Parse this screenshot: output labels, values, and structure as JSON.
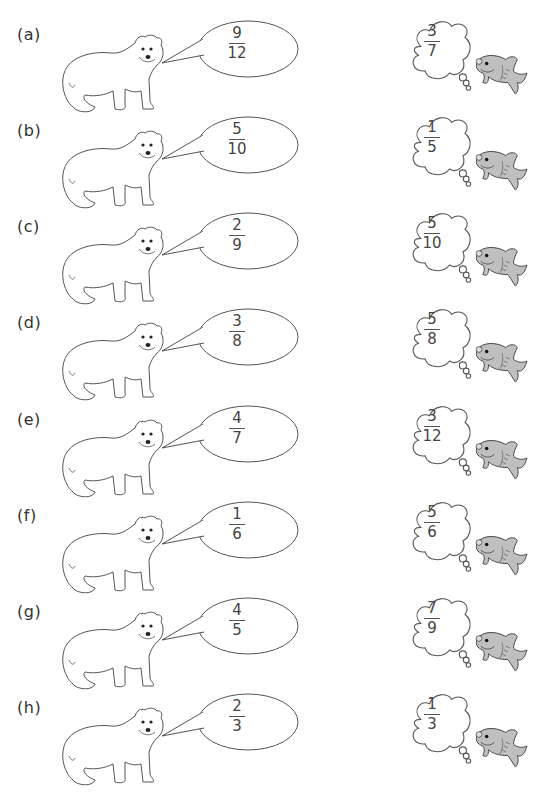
{
  "worksheet": {
    "problems": [
      {
        "label": "(a)",
        "bear_fraction": {
          "numerator": "9",
          "denominator": "12"
        },
        "fish_fraction": {
          "numerator": "3",
          "denominator": "7"
        }
      },
      {
        "label": "(b)",
        "bear_fraction": {
          "numerator": "5",
          "denominator": "10"
        },
        "fish_fraction": {
          "numerator": "1",
          "denominator": "5"
        }
      },
      {
        "label": "(c)",
        "bear_fraction": {
          "numerator": "2",
          "denominator": "9"
        },
        "fish_fraction": {
          "numerator": "5",
          "denominator": "10"
        }
      },
      {
        "label": "(d)",
        "bear_fraction": {
          "numerator": "3",
          "denominator": "8"
        },
        "fish_fraction": {
          "numerator": "5",
          "denominator": "8"
        }
      },
      {
        "label": "(e)",
        "bear_fraction": {
          "numerator": "4",
          "denominator": "7"
        },
        "fish_fraction": {
          "numerator": "3",
          "denominator": "12"
        }
      },
      {
        "label": "(f)",
        "bear_fraction": {
          "numerator": "1",
          "denominator": "6"
        },
        "fish_fraction": {
          "numerator": "5",
          "denominator": "6"
        }
      },
      {
        "label": "(g)",
        "bear_fraction": {
          "numerator": "4",
          "denominator": "5"
        },
        "fish_fraction": {
          "numerator": "7",
          "denominator": "9"
        }
      },
      {
        "label": "(h)",
        "bear_fraction": {
          "numerator": "2",
          "denominator": "3"
        },
        "fish_fraction": {
          "numerator": "1",
          "denominator": "3"
        }
      }
    ],
    "icons": {
      "bear": "polar-bear-icon",
      "speech": "speech-bubble-icon",
      "thought": "thought-cloud-icon",
      "fish": "fish-icon"
    },
    "colors": {
      "line": "#555555",
      "fish_fill": "#bfbfbf",
      "background": "#ffffff"
    }
  }
}
